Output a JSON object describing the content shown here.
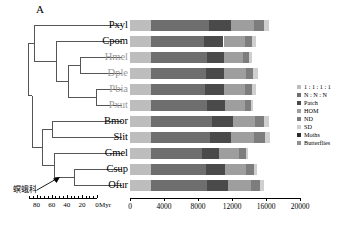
{
  "panel": {
    "letter": "A"
  },
  "annotation": {
    "family_cn": "螟蛾科",
    "arrow": "arrow-to-ofur-clade"
  },
  "taxa": [
    {
      "abbr": "Pxyl",
      "group": "moth"
    },
    {
      "abbr": "Cpom",
      "group": "moth"
    },
    {
      "abbr": "Hmel",
      "group": "butterfly"
    },
    {
      "abbr": "Dple",
      "group": "butterfly"
    },
    {
      "abbr": "Pbia",
      "group": "butterfly"
    },
    {
      "abbr": "Pxut",
      "group": "butterfly"
    },
    {
      "abbr": "Bmor",
      "group": "moth"
    },
    {
      "abbr": "Slit",
      "group": "moth"
    },
    {
      "abbr": "Gmel",
      "group": "moth"
    },
    {
      "abbr": "Csup",
      "group": "moth"
    },
    {
      "abbr": "Ofur",
      "group": "moth"
    }
  ],
  "legend": {
    "items": [
      {
        "label": "1 : 1 : 1 : 1",
        "color": "#bdbdbd"
      },
      {
        "label": "N : N : N",
        "color": "#6e6e6e"
      },
      {
        "label": "Patch",
        "color": "#4a4a4a"
      },
      {
        "label": "HOM",
        "color": "#9e9e9e"
      },
      {
        "label": "ND",
        "color": "#7d7d7d"
      },
      {
        "label": "SD",
        "color": "#cfcfcf"
      },
      {
        "label": "Moths",
        "color": "#2b2b2b"
      },
      {
        "label": "Butterflies",
        "color": "#8f8f8f"
      }
    ]
  },
  "chart_data": {
    "type": "bar",
    "title": "",
    "xlabel": "",
    "ylabel": "",
    "orientation": "horizontal",
    "stacked": true,
    "grid": false,
    "legend_position": "right",
    "xlim": [
      0,
      20000
    ],
    "xticks": [
      0,
      4000,
      8000,
      12000,
      16000,
      20000
    ],
    "xticklabels": [
      "0",
      "4000",
      "8000",
      "12000",
      "16000",
      "20000"
    ],
    "categories": [
      "Pxyl",
      "Cpom",
      "Hmel",
      "Dple",
      "Pbia",
      "Pxut",
      "Bmor",
      "Slit",
      "Gmel",
      "Csup",
      "Ofur"
    ],
    "series": [
      {
        "name": "1 : 1 : 1 : 1",
        "color": "#bdbdbd",
        "values": [
          2500,
          2500,
          2500,
          2500,
          2500,
          2500,
          2500,
          2500,
          2500,
          2500,
          2500
        ]
      },
      {
        "name": "N : N : N",
        "color": "#6e6e6e",
        "values": [
          6800,
          6200,
          6500,
          6400,
          6300,
          6600,
          7200,
          6900,
          6000,
          6400,
          6600
        ]
      },
      {
        "name": "Patch",
        "color": "#4a4a4a",
        "values": [
          2600,
          2300,
          2100,
          2200,
          2300,
          2100,
          2400,
          2500,
          2000,
          2300,
          2400
        ]
      },
      {
        "name": "HOM",
        "color": "#9e9e9e",
        "values": [
          2700,
          2500,
          2200,
          2600,
          2400,
          2300,
          2600,
          2700,
          2300,
          2500,
          2700
        ]
      },
      {
        "name": "ND",
        "color": "#7d7d7d",
        "values": [
          1200,
          900,
          700,
          800,
          900,
          700,
          1100,
          1300,
          800,
          900,
          1100
        ]
      },
      {
        "name": "SD",
        "color": "#cfcfcf",
        "values": [
          600,
          400,
          300,
          500,
          400,
          300,
          500,
          600,
          300,
          400,
          500
        ]
      }
    ],
    "totals": [
      16400,
      14800,
      14300,
      15000,
      14800,
      14500,
      16300,
      16500,
      13900,
      15000,
      15800
    ]
  },
  "time_axis": {
    "unit": "Myr",
    "ticks": [
      80,
      60,
      40,
      20,
      0
    ],
    "ticklabels": [
      "80",
      "60",
      "40",
      "20",
      "0"
    ],
    "range": [
      90,
      0
    ]
  }
}
